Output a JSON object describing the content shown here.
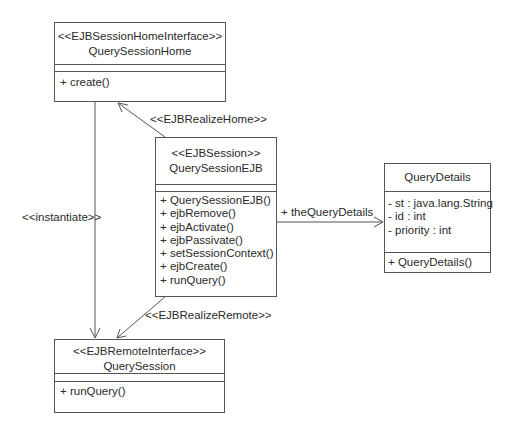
{
  "classes": {
    "home": {
      "stereotype": "<<EJBSessionHomeInterface>>",
      "name": "QuerySessionHome",
      "attributes": [],
      "operations": [
        "+ create()"
      ]
    },
    "ejb": {
      "stereotype": "<<EJBSession>>",
      "name": "QuerySessionEJB",
      "attributes": [],
      "operations": [
        "+ QuerySessionEJB()",
        "+ ejbRemove()",
        "+ ejbActivate()",
        "+ ejbPassivate()",
        "+ setSessionContext()",
        "+ ejbCreate()",
        "+ runQuery()"
      ]
    },
    "remote": {
      "stereotype": "<<EJBRemoteInterface>>",
      "name": "QuerySession",
      "attributes": [],
      "operations": [
        "+ runQuery()"
      ]
    },
    "details": {
      "stereotype": "",
      "name": "QueryDetails",
      "attributes": [
        "- st : java.lang.String",
        "- id : int",
        "- priority : int"
      ],
      "operations": [
        "+ QueryDetails()"
      ]
    }
  },
  "relations": {
    "realize_home": "<<EJBRealizeHome>>",
    "instantiate": "<<instantiate>>",
    "realize_remote": "<<EJBRealizeRemote>>",
    "association": "+ theQueryDetails"
  },
  "colors": {
    "line": "#555555",
    "text": "#2a2a2a"
  }
}
